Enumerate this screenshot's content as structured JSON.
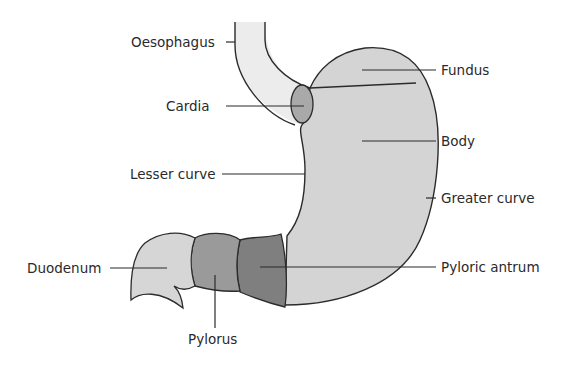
{
  "diagram": {
    "colors": {
      "stomach": "#d4d4d4",
      "oesophagus": "#ececec",
      "cardia": "#a9a9a9",
      "duodenum": "#d6d6d6",
      "pylorus": "#9a9a9a",
      "pyloric_antrum": "#7f7f7f",
      "outline": "#2b2b2b"
    },
    "labels": {
      "oesophagus": "Oesophagus",
      "cardia": "Cardia",
      "lesser_curve": "Lesser curve",
      "duodenum": "Duodenum",
      "pylorus": "Pylorus",
      "fundus": "Fundus",
      "body": "Body",
      "greater_curve": "Greater curve",
      "pyloric_antrum": "Pyloric antrum"
    }
  }
}
